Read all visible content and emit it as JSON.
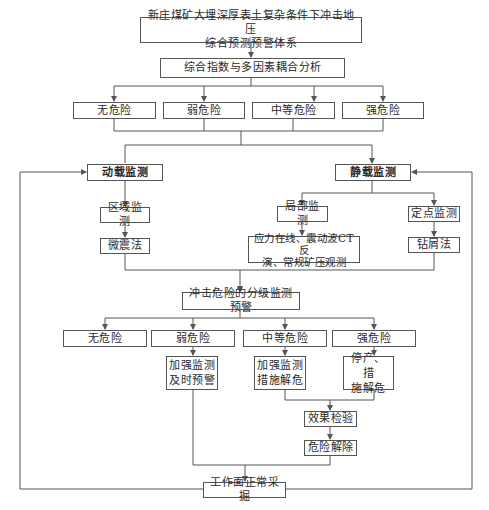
{
  "diagram": {
    "title_box": {
      "line1": "新庄煤矿大埋深厚表土复杂条件下冲击地压",
      "line2": "综合预测预警体系"
    },
    "analysis_box": "综合指数与多因素耦合分析",
    "risk_levels_1": [
      "无危险",
      "弱危险",
      "中等危险",
      "强危险"
    ],
    "dynamic_monitoring": {
      "label": "动载监测",
      "sub": "区域监测",
      "method": "微震法"
    },
    "static_monitoring": {
      "label": "静载监测",
      "local": "局部监测",
      "local_method": {
        "line1": "应力在线、震动波CT反",
        "line2": "演、常规矿压观测"
      },
      "point": "定点监测",
      "point_method": "钻屑法"
    },
    "graded_warning": "冲击危险的分级监测预警",
    "risk_levels_2": [
      "无危险",
      "弱危险",
      "中等危险",
      "强危险"
    ],
    "actions": {
      "weak": {
        "line1": "加强监测",
        "line2": "及时预警"
      },
      "medium": {
        "line1": "加强监测",
        "line2": "措施解危"
      },
      "strong": {
        "line1": "停产、措",
        "line2": "施解危"
      }
    },
    "effect_check": "效果检验",
    "risk_cleared": "危险解除",
    "normal_mining": "工作面正常采掘",
    "line_color": "#555555"
  }
}
